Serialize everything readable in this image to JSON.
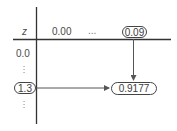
{
  "diagram": {
    "type": "z-table-lookup",
    "header": {
      "corner_label": "z",
      "columns": [
        "0.00",
        "...",
        "0.09"
      ],
      "highlighted_column": "0.09"
    },
    "rows": {
      "labels": [
        "0.0",
        "⋮",
        "1.3",
        "⋮"
      ],
      "highlighted_row": "1.3"
    },
    "result": {
      "value": "0.9177",
      "row": "1.3",
      "column": "0.09"
    },
    "colors": {
      "line": "#444444",
      "text": "#4a4a4a",
      "background": "#ffffff"
    }
  }
}
